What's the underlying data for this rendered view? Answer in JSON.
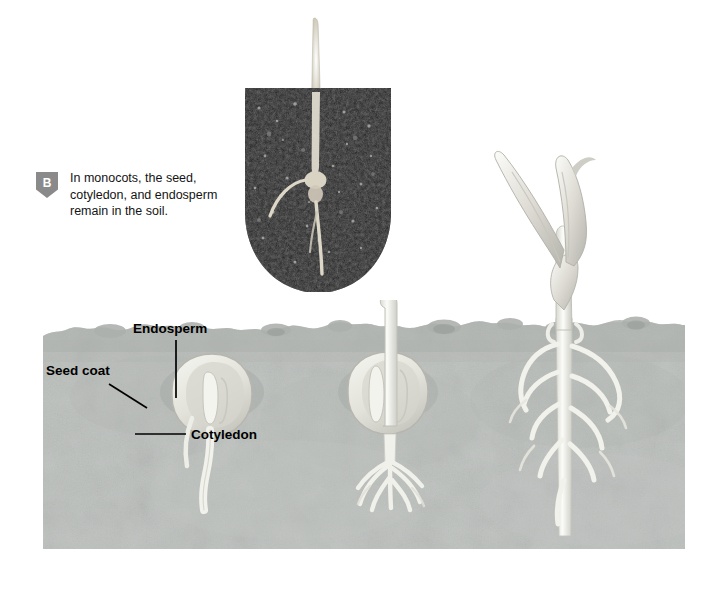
{
  "figure": {
    "background_color": "#ffffff"
  },
  "caption": {
    "badge_letter": "B",
    "badge_color": "#8a8a8a",
    "text": "In monocots, the seed, cotyledon, and endosperm remain in the soil.",
    "lines": [
      "In monocots, the seed,",
      "cotyledon, and endosperm",
      "remain in the soil."
    ]
  },
  "photograph": {
    "name": "germinating-seed-in-soil-photo",
    "description": "Cross-section photograph of dark potting soil with a pale seedling shoot emerging upward and roots below",
    "soil_color": "#1d1d1d",
    "shoot_color": "#d8d4c8",
    "shape": "rounded-shield"
  },
  "diagram": {
    "soil_color": "#b9bdba",
    "soil_shadow_color": "#9aa09d",
    "plant_color": "#efefea",
    "stages": [
      {
        "name": "stage-1-seed",
        "order": 1,
        "description": "Dormant seed below soil with seed coat, endosperm, cotyledon and emerging radicle"
      },
      {
        "name": "stage-2-shoot-emerging",
        "order": 2,
        "description": "Seed with shoot breaking through soil surface and fibrous roots developing"
      },
      {
        "name": "stage-3-seedling",
        "order": 3,
        "description": "Young seedling above ground with two leaves and an extensive fibrous root system"
      }
    ],
    "labels": [
      {
        "name": "endosperm",
        "text": "Endosperm"
      },
      {
        "name": "seed-coat",
        "text": "Seed coat"
      },
      {
        "name": "cotyledon",
        "text": "Cotyledon"
      }
    ]
  }
}
